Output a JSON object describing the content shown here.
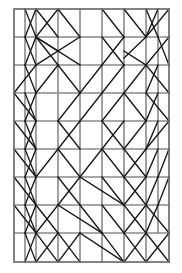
{
  "figure": {
    "type": "line-diagram",
    "width": 182,
    "height": 273,
    "background_color": "#ffffff",
    "grid_color": "#8a8a8a",
    "border_color": "#6e6e6e",
    "diagonal_color": "#1a1a1a",
    "border": {
      "x": 14,
      "y": 9,
      "width": 155,
      "height": 253
    },
    "columns_x": [
      14,
      36,
      58,
      80,
      102,
      124,
      146,
      169
    ],
    "rows_y": [
      9,
      37,
      65,
      93,
      121,
      149,
      177,
      205,
      233,
      262
    ],
    "column_count": 7,
    "row_count": 9,
    "vertical_lines": [
      {
        "x": 36,
        "y1": 9,
        "y2": 262
      },
      {
        "x": 58,
        "y1": 9,
        "y2": 262
      },
      {
        "x": 80,
        "y1": 9,
        "y2": 262
      },
      {
        "x": 102,
        "y1": 9,
        "y2": 262
      },
      {
        "x": 124,
        "y1": 9,
        "y2": 262
      },
      {
        "x": 146,
        "y1": 9,
        "y2": 262
      },
      {
        "x": 25,
        "y1": 9,
        "y2": 262
      },
      {
        "x": 158,
        "y1": 9,
        "y2": 233
      }
    ],
    "horizontal_lines": [
      {
        "y": 37,
        "x1": 14,
        "x2": 169
      },
      {
        "y": 65,
        "x1": 14,
        "x2": 169
      },
      {
        "y": 93,
        "x1": 14,
        "x2": 169
      },
      {
        "y": 121,
        "x1": 14,
        "x2": 169
      },
      {
        "y": 149,
        "x1": 14,
        "x2": 169
      },
      {
        "y": 177,
        "x1": 14,
        "x2": 169
      },
      {
        "y": 205,
        "x1": 14,
        "x2": 169
      },
      {
        "y": 233,
        "x1": 14,
        "x2": 169
      }
    ],
    "diagonal_lines": [
      {
        "x1": 25,
        "y1": 9,
        "x2": 36,
        "y2": 37
      },
      {
        "x1": 36,
        "y1": 9,
        "x2": 25,
        "y2": 37
      },
      {
        "x1": 36,
        "y1": 9,
        "x2": 58,
        "y2": 37
      },
      {
        "x1": 58,
        "y1": 9,
        "x2": 36,
        "y2": 37
      },
      {
        "x1": 58,
        "y1": 9,
        "x2": 80,
        "y2": 37
      },
      {
        "x1": 102,
        "y1": 9,
        "x2": 124,
        "y2": 37
      },
      {
        "x1": 124,
        "y1": 9,
        "x2": 146,
        "y2": 37
      },
      {
        "x1": 146,
        "y1": 9,
        "x2": 158,
        "y2": 37
      },
      {
        "x1": 158,
        "y1": 9,
        "x2": 146,
        "y2": 37
      },
      {
        "x1": 169,
        "y1": 9,
        "x2": 146,
        "y2": 37
      },
      {
        "x1": 25,
        "y1": 37,
        "x2": 36,
        "y2": 65
      },
      {
        "x1": 36,
        "y1": 37,
        "x2": 25,
        "y2": 65
      },
      {
        "x1": 36,
        "y1": 37,
        "x2": 58,
        "y2": 65
      },
      {
        "x1": 36,
        "y1": 37,
        "x2": 80,
        "y2": 65
      },
      {
        "x1": 36,
        "y1": 37,
        "x2": 58,
        "y2": 51
      },
      {
        "x1": 80,
        "y1": 37,
        "x2": 36,
        "y2": 65
      },
      {
        "x1": 102,
        "y1": 37,
        "x2": 124,
        "y2": 65
      },
      {
        "x1": 124,
        "y1": 37,
        "x2": 102,
        "y2": 65
      },
      {
        "x1": 146,
        "y1": 37,
        "x2": 124,
        "y2": 58
      },
      {
        "x1": 124,
        "y1": 51,
        "x2": 146,
        "y2": 65
      },
      {
        "x1": 158,
        "y1": 37,
        "x2": 169,
        "y2": 65
      },
      {
        "x1": 169,
        "y1": 37,
        "x2": 146,
        "y2": 65
      },
      {
        "x1": 36,
        "y1": 65,
        "x2": 14,
        "y2": 93
      },
      {
        "x1": 25,
        "y1": 65,
        "x2": 36,
        "y2": 93
      },
      {
        "x1": 58,
        "y1": 65,
        "x2": 36,
        "y2": 93
      },
      {
        "x1": 58,
        "y1": 65,
        "x2": 80,
        "y2": 93
      },
      {
        "x1": 102,
        "y1": 65,
        "x2": 80,
        "y2": 93
      },
      {
        "x1": 124,
        "y1": 65,
        "x2": 102,
        "y2": 93
      },
      {
        "x1": 146,
        "y1": 65,
        "x2": 124,
        "y2": 93
      },
      {
        "x1": 146,
        "y1": 65,
        "x2": 169,
        "y2": 93
      },
      {
        "x1": 158,
        "y1": 65,
        "x2": 146,
        "y2": 93
      },
      {
        "x1": 14,
        "y1": 93,
        "x2": 36,
        "y2": 121
      },
      {
        "x1": 25,
        "y1": 93,
        "x2": 36,
        "y2": 121
      },
      {
        "x1": 36,
        "y1": 93,
        "x2": 25,
        "y2": 121
      },
      {
        "x1": 80,
        "y1": 93,
        "x2": 58,
        "y2": 121
      },
      {
        "x1": 102,
        "y1": 93,
        "x2": 80,
        "y2": 121
      },
      {
        "x1": 124,
        "y1": 93,
        "x2": 102,
        "y2": 121
      },
      {
        "x1": 124,
        "y1": 93,
        "x2": 146,
        "y2": 121
      },
      {
        "x1": 146,
        "y1": 93,
        "x2": 169,
        "y2": 121
      },
      {
        "x1": 158,
        "y1": 93,
        "x2": 146,
        "y2": 121
      },
      {
        "x1": 14,
        "y1": 121,
        "x2": 36,
        "y2": 149
      },
      {
        "x1": 25,
        "y1": 121,
        "x2": 36,
        "y2": 149
      },
      {
        "x1": 36,
        "y1": 121,
        "x2": 25,
        "y2": 149
      },
      {
        "x1": 58,
        "y1": 121,
        "x2": 80,
        "y2": 149
      },
      {
        "x1": 80,
        "y1": 121,
        "x2": 58,
        "y2": 149
      },
      {
        "x1": 102,
        "y1": 121,
        "x2": 124,
        "y2": 149
      },
      {
        "x1": 124,
        "y1": 121,
        "x2": 102,
        "y2": 149
      },
      {
        "x1": 146,
        "y1": 121,
        "x2": 124,
        "y2": 149
      },
      {
        "x1": 158,
        "y1": 121,
        "x2": 146,
        "y2": 149
      },
      {
        "x1": 169,
        "y1": 121,
        "x2": 146,
        "y2": 149
      },
      {
        "x1": 14,
        "y1": 149,
        "x2": 36,
        "y2": 177
      },
      {
        "x1": 25,
        "y1": 149,
        "x2": 36,
        "y2": 177
      },
      {
        "x1": 36,
        "y1": 149,
        "x2": 25,
        "y2": 177
      },
      {
        "x1": 58,
        "y1": 149,
        "x2": 36,
        "y2": 177
      },
      {
        "x1": 58,
        "y1": 149,
        "x2": 80,
        "y2": 177
      },
      {
        "x1": 102,
        "y1": 149,
        "x2": 80,
        "y2": 177
      },
      {
        "x1": 102,
        "y1": 149,
        "x2": 124,
        "y2": 177
      },
      {
        "x1": 124,
        "y1": 149,
        "x2": 146,
        "y2": 177
      },
      {
        "x1": 146,
        "y1": 149,
        "x2": 124,
        "y2": 177
      },
      {
        "x1": 158,
        "y1": 149,
        "x2": 146,
        "y2": 177
      },
      {
        "x1": 169,
        "y1": 149,
        "x2": 158,
        "y2": 177
      },
      {
        "x1": 14,
        "y1": 177,
        "x2": 36,
        "y2": 205
      },
      {
        "x1": 25,
        "y1": 177,
        "x2": 36,
        "y2": 205
      },
      {
        "x1": 36,
        "y1": 177,
        "x2": 25,
        "y2": 205
      },
      {
        "x1": 58,
        "y1": 177,
        "x2": 80,
        "y2": 205
      },
      {
        "x1": 80,
        "y1": 177,
        "x2": 58,
        "y2": 205
      },
      {
        "x1": 80,
        "y1": 177,
        "x2": 124,
        "y2": 205
      },
      {
        "x1": 102,
        "y1": 177,
        "x2": 124,
        "y2": 205
      },
      {
        "x1": 124,
        "y1": 177,
        "x2": 146,
        "y2": 205
      },
      {
        "x1": 146,
        "y1": 177,
        "x2": 124,
        "y2": 205
      },
      {
        "x1": 158,
        "y1": 177,
        "x2": 146,
        "y2": 205
      },
      {
        "x1": 169,
        "y1": 177,
        "x2": 158,
        "y2": 205
      },
      {
        "x1": 14,
        "y1": 205,
        "x2": 36,
        "y2": 233
      },
      {
        "x1": 25,
        "y1": 205,
        "x2": 36,
        "y2": 233
      },
      {
        "x1": 36,
        "y1": 205,
        "x2": 25,
        "y2": 233
      },
      {
        "x1": 36,
        "y1": 205,
        "x2": 58,
        "y2": 233
      },
      {
        "x1": 58,
        "y1": 205,
        "x2": 36,
        "y2": 233
      },
      {
        "x1": 58,
        "y1": 205,
        "x2": 102,
        "y2": 233
      },
      {
        "x1": 80,
        "y1": 205,
        "x2": 102,
        "y2": 233
      },
      {
        "x1": 102,
        "y1": 205,
        "x2": 124,
        "y2": 233
      },
      {
        "x1": 124,
        "y1": 205,
        "x2": 146,
        "y2": 233
      },
      {
        "x1": 146,
        "y1": 205,
        "x2": 124,
        "y2": 233
      },
      {
        "x1": 146,
        "y1": 205,
        "x2": 169,
        "y2": 233
      },
      {
        "x1": 158,
        "y1": 205,
        "x2": 146,
        "y2": 233
      },
      {
        "x1": 25,
        "y1": 233,
        "x2": 36,
        "y2": 262
      },
      {
        "x1": 36,
        "y1": 233,
        "x2": 25,
        "y2": 262
      },
      {
        "x1": 36,
        "y1": 233,
        "x2": 58,
        "y2": 262
      },
      {
        "x1": 58,
        "y1": 233,
        "x2": 36,
        "y2": 262
      },
      {
        "x1": 58,
        "y1": 233,
        "x2": 80,
        "y2": 262
      },
      {
        "x1": 80,
        "y1": 233,
        "x2": 58,
        "y2": 262
      },
      {
        "x1": 80,
        "y1": 233,
        "x2": 124,
        "y2": 262
      },
      {
        "x1": 102,
        "y1": 233,
        "x2": 124,
        "y2": 262
      },
      {
        "x1": 124,
        "y1": 233,
        "x2": 146,
        "y2": 262
      },
      {
        "x1": 146,
        "y1": 233,
        "x2": 124,
        "y2": 262
      },
      {
        "x1": 146,
        "y1": 233,
        "x2": 169,
        "y2": 262
      },
      {
        "x1": 169,
        "y1": 233,
        "x2": 146,
        "y2": 262
      }
    ]
  }
}
